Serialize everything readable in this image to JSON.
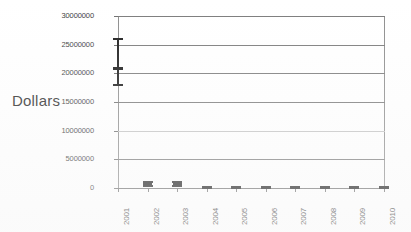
{
  "chart_data": {
    "type": "bar",
    "title": "",
    "xlabel": "",
    "ylabel": "Dollars",
    "ylim": [
      0,
      30000000
    ],
    "grid": true,
    "legend": "none",
    "categories": [
      "2001",
      "2002",
      "2003",
      "2004",
      "2005",
      "2006",
      "2007",
      "2008",
      "2009",
      "2010"
    ],
    "ytick_labels": [
      "30000000",
      "25000000",
      "20000000",
      "15000000",
      "10000000",
      "5000000",
      "0"
    ],
    "ytick_values": [
      30000000,
      25000000,
      20000000,
      15000000,
      10000000,
      5000000,
      0
    ],
    "series": [
      {
        "name": "Dollars",
        "values": [
          20800000,
          700000,
          700000,
          120000,
          120000,
          120000,
          120000,
          120000,
          120000,
          120000
        ],
        "error_low": [
          18000000,
          400000,
          400000,
          60000,
          60000,
          60000,
          60000,
          60000,
          60000,
          60000
        ],
        "error_high": [
          26000000,
          1000000,
          1000000,
          190000,
          190000,
          190000,
          190000,
          190000,
          190000,
          190000
        ]
      }
    ],
    "annotations": []
  },
  "axis": {
    "y_title": "Dollars"
  },
  "colors": {
    "marker": "#1a1a1a",
    "gridline": "#7b7b7b",
    "gridline_faint": "#c3c3c3",
    "axis": "#6f6f6f",
    "text": "#343434",
    "background": "#ffffff"
  }
}
